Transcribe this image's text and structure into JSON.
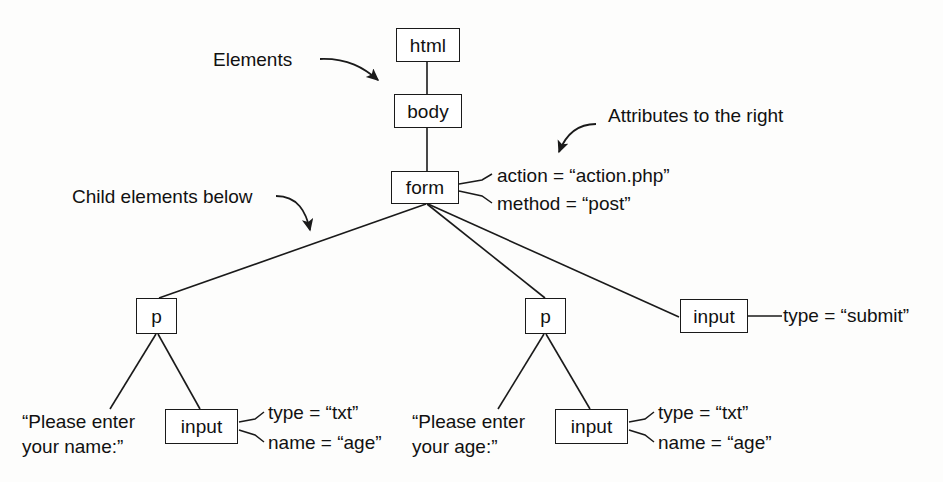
{
  "diagram": {
    "stroke_color": "#1a1a1a",
    "background_color": "#fdfdfc",
    "text_color": "#111111"
  },
  "nodes": {
    "html": {
      "label": "html"
    },
    "body": {
      "label": "body"
    },
    "form": {
      "label": "form"
    },
    "p_name": {
      "label": "p"
    },
    "p_age": {
      "label": "p"
    },
    "input_name": {
      "label": "input"
    },
    "input_age": {
      "label": "input"
    },
    "input_submit": {
      "label": "input"
    }
  },
  "attributes": {
    "form_action": "action = “action.php”",
    "form_method": "method = “post”",
    "input_name_type": "type = “txt”",
    "input_name_name": "name = “age”",
    "input_age_type": "type = “txt”",
    "input_age_name": "name = “age”",
    "input_submit_type": "type = “submit”"
  },
  "text_nodes": {
    "name_prompt_line1": "“Please enter",
    "name_prompt_line2": "your name:”",
    "age_prompt_line1": "“Please enter",
    "age_prompt_line2": "your age:”"
  },
  "annotations": {
    "elements": "Elements",
    "attributes_right": "Attributes to the right",
    "child_elements_below": "Child elements below"
  }
}
